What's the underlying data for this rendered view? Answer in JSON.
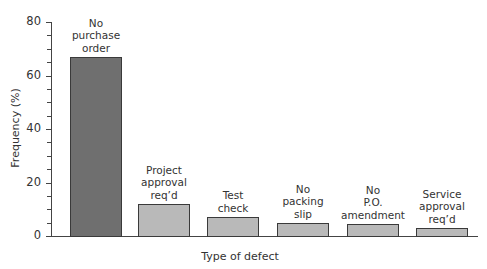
{
  "chart_data": {
    "type": "bar",
    "title": "",
    "xlabel": "Type of defect",
    "ylabel": "Frequency (%)",
    "ylim": [
      0,
      80
    ],
    "yticks": [
      0,
      20,
      40,
      60,
      80
    ],
    "minor_tick_step": 5,
    "grid": false,
    "legend": null,
    "categories": [
      "No purchase order",
      "Project approval req'd",
      "Test check",
      "No packing slip",
      "No P.O. amendment",
      "Service approval req'd"
    ],
    "category_label_lines": [
      [
        "No",
        "purchase",
        "order"
      ],
      [
        "Project",
        "approval",
        "req’d"
      ],
      [
        "Test",
        "check"
      ],
      [
        "No",
        "packing",
        "slip"
      ],
      [
        "No",
        "P.O.",
        "amendment"
      ],
      [
        "Service",
        "approval",
        "req’d"
      ]
    ],
    "values": [
      67,
      12,
      7,
      5,
      4.5,
      3
    ],
    "colors": [
      "#6f6f6f",
      "#b9b9b9",
      "#b9b9b9",
      "#b9b9b9",
      "#b9b9b9",
      "#b9b9b9"
    ]
  }
}
